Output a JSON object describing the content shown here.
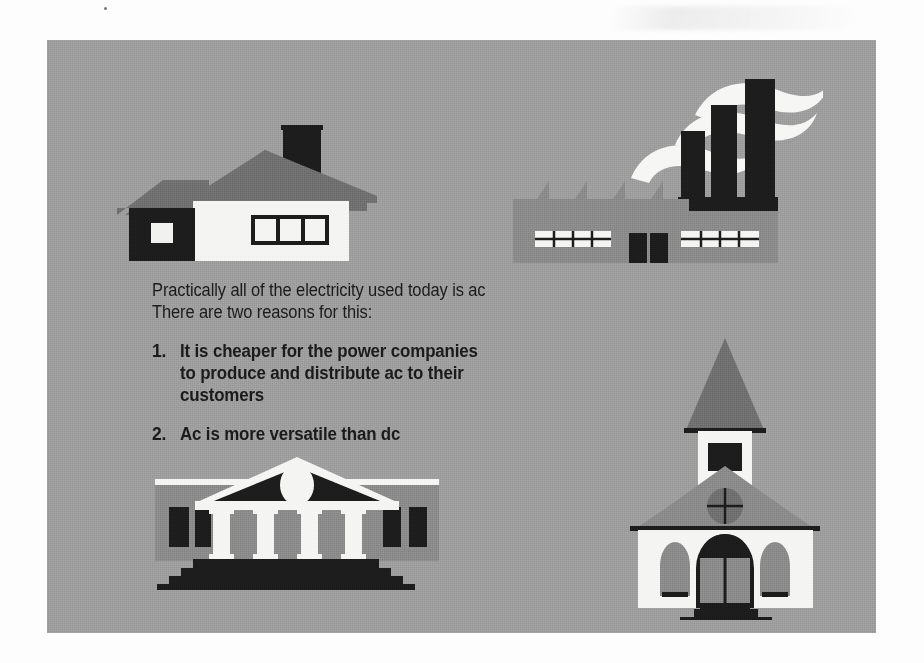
{
  "figure": {
    "caption": {
      "lede": [
        "Practically all of the electricity used today is ac",
        "There are two reasons for this:"
      ],
      "items": [
        {
          "number": "1.",
          "lines": [
            "It is cheaper for the power companies",
            "to produce and distribute ac to their",
            "customers"
          ]
        },
        {
          "number": "2.",
          "lines": [
            "Ac is more versatile than dc"
          ]
        }
      ]
    },
    "illustrations": [
      {
        "name": "house",
        "label": "Residential house with chimney"
      },
      {
        "name": "factory",
        "label": "Factory with smokestacks and smoke"
      },
      {
        "name": "government-building",
        "label": "Columned civic building with steps"
      },
      {
        "name": "church",
        "label": "Church with steeple and arched windows"
      }
    ]
  },
  "colors": {
    "page": "#fdfdfd",
    "panel_background": "#9d9d9d",
    "mid_gray": "#8a8a8a",
    "dark_gray": "#6f6f6f",
    "black": "#1c1c1c",
    "white": "#f4f4f2",
    "text": "#1b1b1b"
  }
}
